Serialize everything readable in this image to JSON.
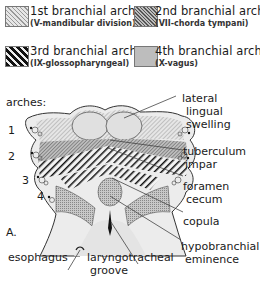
{
  "legend": [
    {
      "title": "1st branchial arch",
      "subtitle": "(V-mandibular division)",
      "pattern": "fine-hatch-light"
    },
    {
      "title": "2nd branchial arch",
      "subtitle": "(VII-chorda tympani)",
      "pattern": "fine-hatch-dark"
    },
    {
      "title": "3rd branchial arch",
      "subtitle": "(IX-glossopharyngeal)",
      "pattern": "bold-diagonal-stripes"
    },
    {
      "title": "4th branchial arch",
      "subtitle": "(X-vagus)",
      "pattern": "stipple-grey"
    }
  ],
  "diagram": {
    "arches_label": "arches:",
    "arch_numbers": [
      "1",
      "2",
      "3",
      "4"
    ],
    "panel_label": "A.",
    "labels": {
      "lateral_lingual_swelling": [
        "lateral",
        "lingual",
        "swelling"
      ],
      "tuberculum_impar": [
        "tuberculum",
        "impar"
      ],
      "foramen_cecum": [
        "foramen",
        "cecum"
      ],
      "copula": [
        "copula"
      ],
      "hypobranchial_eminence": [
        "hypobranchial",
        "eminence"
      ],
      "esophagus": [
        "esophagus"
      ],
      "laryngotracheal_groove": [
        "laryngotracheal",
        "groove"
      ]
    }
  },
  "colors": {
    "line": "#333333",
    "light_fill": "#dcdcdc",
    "mid_fill": "#b8b8b8",
    "dark_fill": "#222222"
  }
}
